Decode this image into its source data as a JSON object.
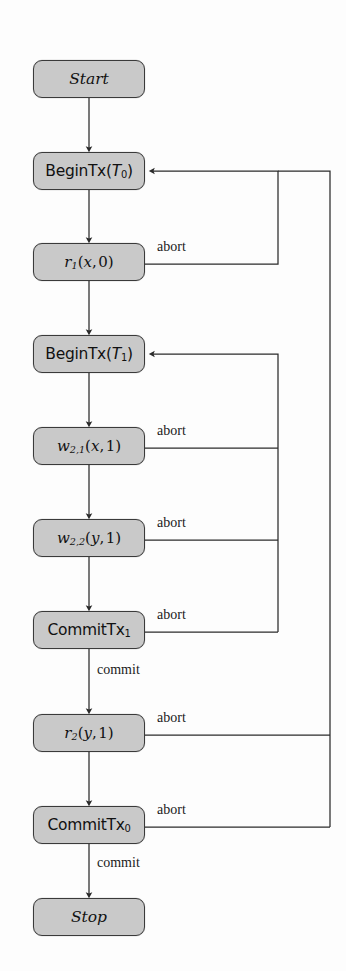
{
  "diagram": {
    "colors": {
      "node_fill": "#c9c9c9",
      "node_stroke": "#3a3a3a",
      "edge_stroke": "#2b2b2b",
      "background": "#fdfdfd",
      "text": "#111111"
    },
    "nodes": [
      {
        "id": "start",
        "label": "Start",
        "style": "italic",
        "x": 33,
        "y": 60,
        "w": 112,
        "h": 38
      },
      {
        "id": "begin_t0",
        "label": "BeginTx(T0)",
        "style": "sans",
        "x": 33,
        "y": 152,
        "w": 112,
        "h": 38
      },
      {
        "id": "r1",
        "label": "r1(x, 0)",
        "style": "math",
        "x": 33,
        "y": 243,
        "w": 112,
        "h": 38
      },
      {
        "id": "begin_t1",
        "label": "BeginTx(T1)",
        "style": "sans",
        "x": 33,
        "y": 335,
        "w": 112,
        "h": 38
      },
      {
        "id": "w21",
        "label": "w2,1(x, 1)",
        "style": "math",
        "x": 33,
        "y": 427,
        "w": 112,
        "h": 38
      },
      {
        "id": "w22",
        "label": "w2,2(y, 1)",
        "style": "math",
        "x": 33,
        "y": 519,
        "w": 112,
        "h": 38
      },
      {
        "id": "commit_t1",
        "label": "CommitTx1",
        "style": "sans",
        "x": 33,
        "y": 611,
        "w": 112,
        "h": 38
      },
      {
        "id": "r2",
        "label": "r2(y, 1)",
        "style": "math",
        "x": 33,
        "y": 714,
        "w": 112,
        "h": 38
      },
      {
        "id": "commit_t0",
        "label": "CommitTx0",
        "style": "sans",
        "x": 33,
        "y": 806,
        "w": 112,
        "h": 38
      },
      {
        "id": "stop",
        "label": "Stop",
        "style": "italic",
        "x": 33,
        "y": 898,
        "w": 112,
        "h": 38
      }
    ],
    "edge_labels": [
      {
        "id": "abort-r1",
        "text": "abort",
        "x": 157,
        "y": 239
      },
      {
        "id": "abort-w21",
        "text": "abort",
        "x": 157,
        "y": 423
      },
      {
        "id": "abort-w22",
        "text": "abort",
        "x": 157,
        "y": 515
      },
      {
        "id": "abort-commit-t1",
        "text": "abort",
        "x": 157,
        "y": 607
      },
      {
        "id": "commit-t1",
        "text": "commit",
        "x": 97,
        "y": 672
      },
      {
        "id": "abort-r2",
        "text": "abort",
        "x": 157,
        "y": 710
      },
      {
        "id": "abort-commit-t0",
        "text": "abort",
        "x": 157,
        "y": 802
      },
      {
        "id": "commit-t0",
        "text": "commit",
        "x": 97,
        "y": 864
      }
    ],
    "flow_edges": [
      {
        "from": "start",
        "to": "begin_t0",
        "label": ""
      },
      {
        "from": "begin_t0",
        "to": "r1",
        "label": ""
      },
      {
        "from": "r1",
        "to": "begin_t1",
        "label": ""
      },
      {
        "from": "begin_t1",
        "to": "w21",
        "label": ""
      },
      {
        "from": "w21",
        "to": "w22",
        "label": ""
      },
      {
        "from": "w22",
        "to": "commit_t1",
        "label": ""
      },
      {
        "from": "commit_t1",
        "to": "r2",
        "label": "commit"
      },
      {
        "from": "r2",
        "to": "commit_t0",
        "label": ""
      },
      {
        "from": "commit_t0",
        "to": "stop",
        "label": "commit"
      }
    ],
    "abort_edges": [
      {
        "from": "r1",
        "to": "begin_t0",
        "label": "abort",
        "lane": "inner"
      },
      {
        "from": "w21",
        "to": "begin_t1",
        "label": "abort",
        "lane": "inner"
      },
      {
        "from": "w22",
        "to": "begin_t1",
        "label": "abort",
        "lane": "inner"
      },
      {
        "from": "commit_t1",
        "to": "begin_t1",
        "label": "abort",
        "lane": "inner"
      },
      {
        "from": "r2",
        "to": "begin_t0",
        "label": "abort",
        "lane": "outer"
      },
      {
        "from": "commit_t0",
        "to": "begin_t0",
        "label": "abort",
        "lane": "outer"
      }
    ],
    "lanes": {
      "inner_x": 278,
      "outer_x": 330
    }
  }
}
